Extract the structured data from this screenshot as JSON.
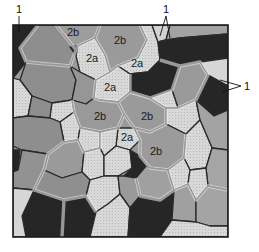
{
  "figure": {
    "type": "grain-structure-schematic",
    "colors": {
      "dark": "#262626",
      "medium": "#8e8e8e",
      "medium_light": "#a9a9a9",
      "light": "#d6d6d6",
      "boundary": "#2a2a2a",
      "halo": "#f4f4f4"
    },
    "labels": [
      {
        "text": "2b",
        "x": 73,
        "y": 32
      },
      {
        "text": "2b",
        "x": 120,
        "y": 41
      },
      {
        "text": "2a",
        "x": 92,
        "y": 59
      },
      {
        "text": "2a",
        "x": 137,
        "y": 64
      },
      {
        "text": "2a",
        "x": 110,
        "y": 88
      },
      {
        "text": "2b",
        "x": 100,
        "y": 117
      },
      {
        "text": "2b",
        "x": 147,
        "y": 117
      },
      {
        "text": "2a",
        "x": 127,
        "y": 138
      },
      {
        "text": "2b",
        "x": 156,
        "y": 152
      }
    ],
    "callouts": [
      {
        "text": "1",
        "x": 19,
        "y": 10
      },
      {
        "text": "1",
        "x": 166,
        "y": 10
      },
      {
        "text": "1",
        "x": 246,
        "y": 87
      }
    ]
  }
}
